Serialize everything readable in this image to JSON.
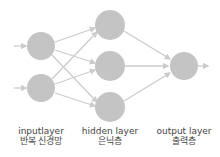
{
  "diagram": {
    "type": "neural-network",
    "colors": {
      "node": "#c4c4c4",
      "edge": "#cccccc",
      "text": "#444444"
    },
    "layers": [
      {
        "name": "input",
        "label_en": "inputlayer",
        "label_ko": "반복 신경망",
        "nodes": 2
      },
      {
        "name": "hidden",
        "label_en": "hidden layer",
        "label_ko": "은닉층",
        "nodes": 3
      },
      {
        "name": "output",
        "label_en": "output layer",
        "label_ko": "출력층",
        "nodes": 1
      }
    ]
  }
}
